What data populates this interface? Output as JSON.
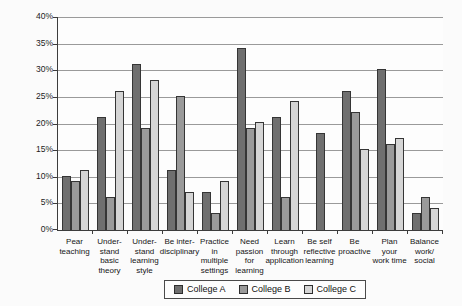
{
  "chart_data": {
    "type": "bar",
    "title": "",
    "xlabel": "",
    "ylabel": "",
    "ylim": [
      0,
      40
    ],
    "ytick_step": 5,
    "ytick_labels": [
      "0%",
      "5%",
      "10%",
      "15%",
      "20%",
      "25%",
      "30%",
      "35%",
      "40%"
    ],
    "grid": true,
    "legend_position": "bottom",
    "categories": [
      "Pear teaching",
      "Understand basic theory",
      "Understand learning style",
      "Be interdisciplinary",
      "Practice in multiple settings",
      "Need passion for learning",
      "Learn through application",
      "Be self reflective learning",
      "Be proactive",
      "Plan your work time",
      "Balance work/social"
    ],
    "categories_lines": [
      [
        "Pear",
        "teaching"
      ],
      [
        "Under-",
        "stand",
        "basic",
        "theory"
      ],
      [
        "Under-",
        "stand",
        "learning",
        "style"
      ],
      [
        "Be inter-",
        "disciplinary"
      ],
      [
        "Practice",
        "in",
        "multiple",
        "settings"
      ],
      [
        "Need",
        "passion",
        "for",
        "learning"
      ],
      [
        "Learn",
        "through",
        "application"
      ],
      [
        "Be self",
        "reflective",
        "learning"
      ],
      [
        "Be",
        "proactive"
      ],
      [
        "Plan",
        "your",
        "work time"
      ],
      [
        "Balance",
        "work/",
        "social"
      ]
    ],
    "series": [
      {
        "name": "College A",
        "color": "#6f6f6f",
        "values": [
          10,
          21,
          31,
          11,
          7,
          34,
          21,
          18,
          26,
          30,
          3
        ]
      },
      {
        "name": "College B",
        "color": "#9a9a9a",
        "values": [
          9,
          6,
          19,
          25,
          3,
          19,
          6,
          0,
          22,
          16,
          6
        ]
      },
      {
        "name": "College C",
        "color": "#d5d5d5",
        "values": [
          11,
          26,
          28,
          7,
          9,
          20,
          24,
          0,
          15,
          17,
          4
        ]
      }
    ]
  }
}
